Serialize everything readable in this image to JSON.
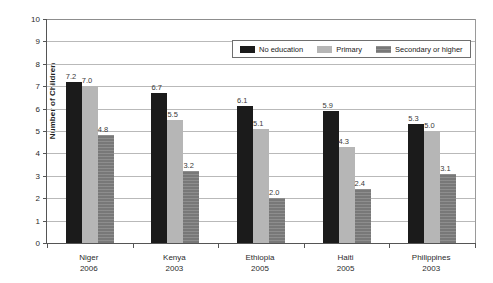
{
  "chart_data": {
    "type": "bar",
    "title": "",
    "xlabel": "",
    "ylabel": "Number of Children",
    "ylim": [
      0,
      10
    ],
    "ytick_labels": [
      "10",
      "9",
      "8",
      "7",
      "6",
      "5",
      "4",
      "3",
      "2",
      "1",
      "0"
    ],
    "grid": true,
    "legend_position": "top-right",
    "categories": [
      {
        "name": "Niger",
        "year": "2006"
      },
      {
        "name": "Kenya",
        "year": "2003"
      },
      {
        "name": "Ethiopia",
        "year": "2005"
      },
      {
        "name": "Haiti",
        "year": "2005"
      },
      {
        "name": "Philippines",
        "year": "2003"
      }
    ],
    "series": [
      {
        "name": "No education",
        "color": "#1b1b1b",
        "values": [
          7.2,
          6.7,
          6.1,
          5.9,
          5.3
        ],
        "labels": [
          "7.2",
          "6.7",
          "6.1",
          "5.9",
          "5.3"
        ]
      },
      {
        "name": "Primary",
        "color": "#b6b6b6",
        "values": [
          7.0,
          5.5,
          5.1,
          4.3,
          5.0
        ],
        "labels": [
          "7.0",
          "5.5",
          "5.1",
          "4.3",
          "5.0"
        ]
      },
      {
        "name": "Secondary or higher",
        "color": "#787878",
        "values": [
          4.8,
          3.2,
          2.0,
          2.4,
          3.1
        ],
        "labels": [
          "4.8",
          "3.2",
          "2.0",
          "2.4",
          "3.1"
        ]
      }
    ]
  }
}
